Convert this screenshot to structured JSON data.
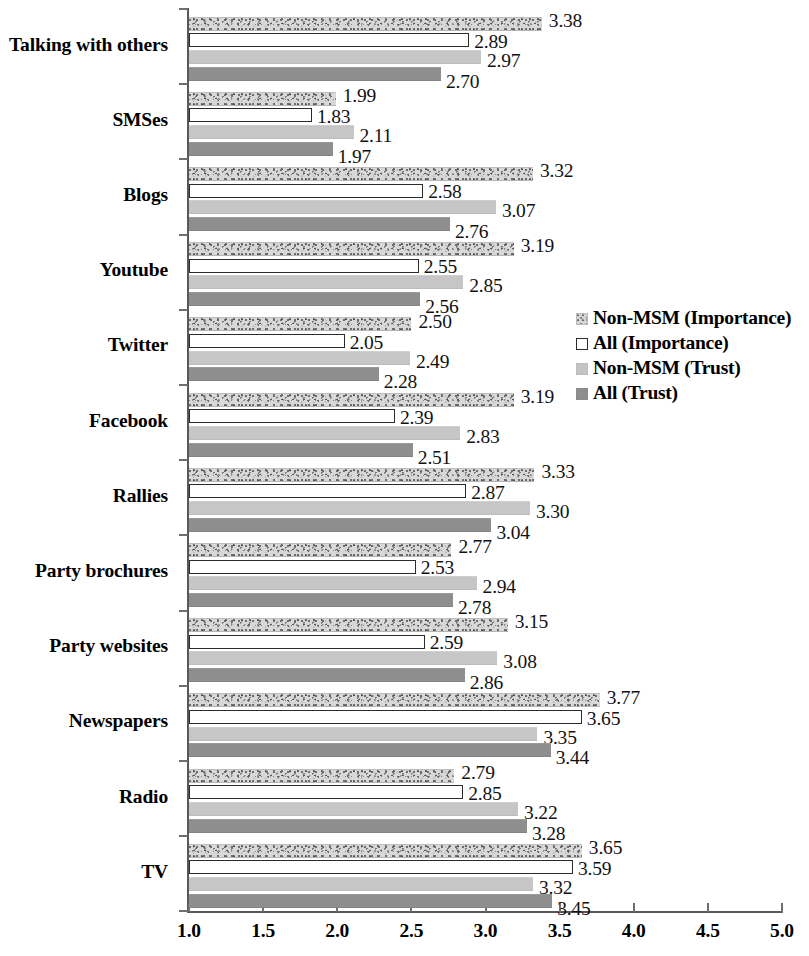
{
  "chart_data": {
    "type": "bar",
    "orientation": "horizontal",
    "title": "",
    "xlabel": "",
    "ylabel": "",
    "xlim": [
      1.0,
      5.0
    ],
    "xticks": [
      "1.0",
      "1.5",
      "2.0",
      "2.5",
      "3.0",
      "3.5",
      "4.0",
      "4.5",
      "5.0"
    ],
    "grid": false,
    "legend_position": "center-right",
    "categories": [
      "Talking with others",
      "SMSes",
      "Blogs",
      "Youtube",
      "Twitter",
      "Facebook",
      "Rallies",
      "Party brochures",
      "Party websites",
      "Newspapers",
      "Radio",
      "TV"
    ],
    "series": [
      {
        "name": "Non-MSM (Importance)",
        "style": "speckled",
        "color": "#d8d8d8",
        "values": [
          3.38,
          1.99,
          3.32,
          3.19,
          2.5,
          3.19,
          3.33,
          2.77,
          3.15,
          3.77,
          2.79,
          3.65
        ]
      },
      {
        "name": "All (Importance)",
        "style": "outline",
        "color": "#ffffff",
        "values": [
          2.89,
          1.83,
          2.58,
          2.55,
          2.05,
          2.39,
          2.87,
          2.53,
          2.59,
          3.65,
          2.85,
          3.59
        ]
      },
      {
        "name": "Non-MSM (Trust)",
        "style": "light-solid",
        "color": "#c6c6c6",
        "values": [
          2.97,
          2.11,
          3.07,
          2.85,
          2.49,
          2.83,
          3.3,
          2.94,
          3.08,
          3.35,
          3.22,
          3.32
        ]
      },
      {
        "name": "All (Trust)",
        "style": "dark-solid",
        "color": "#8e8e8e",
        "values": [
          2.7,
          1.97,
          2.76,
          2.56,
          2.28,
          2.51,
          3.04,
          2.78,
          2.86,
          3.44,
          3.28,
          3.45
        ]
      }
    ]
  },
  "legend": {
    "items": [
      {
        "label": "Non-MSM (Importance)",
        "swatch": "s0"
      },
      {
        "label": "All (Importance)",
        "swatch": "s1"
      },
      {
        "label": "Non-MSM (Trust)",
        "swatch": "s2"
      },
      {
        "label": "All (Trust)",
        "swatch": "s3"
      }
    ]
  }
}
